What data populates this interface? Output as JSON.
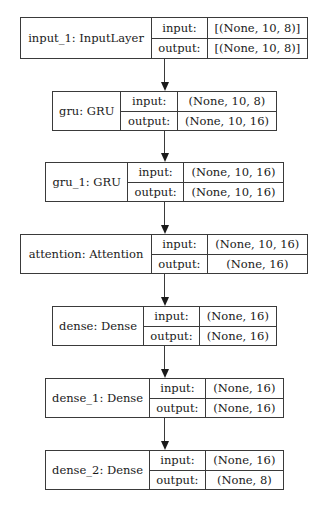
{
  "diagram": {
    "type": "keras-model-plot",
    "nodes": [
      {
        "id": "input_1",
        "label": "input_1: InputLayer",
        "input_key": "input:",
        "input_value": "[(None, 10, 8)]",
        "output_key": "output:",
        "output_value": "[(None, 10, 8)]",
        "layout": {
          "left": 20,
          "top": 17,
          "label_w": 132,
          "key_w": 56,
          "val_w": 100,
          "h": 42
        }
      },
      {
        "id": "gru",
        "label": "gru: GRU",
        "input_key": "input:",
        "input_value": "(None, 10, 8)",
        "output_key": "output:",
        "output_value": "(None, 10, 16)",
        "layout": {
          "left": 52,
          "top": 91,
          "label_w": 69,
          "key_w": 57,
          "val_w": 99,
          "h": 40
        }
      },
      {
        "id": "gru_1",
        "label": "gru_1: GRU",
        "input_key": "input:",
        "input_value": "(None, 10, 16)",
        "output_key": "output:",
        "output_value": "(None, 10, 16)",
        "layout": {
          "left": 45,
          "top": 162,
          "label_w": 83,
          "key_w": 56,
          "val_w": 100,
          "h": 40
        }
      },
      {
        "id": "attention",
        "label": "attention: Attention",
        "input_key": "input:",
        "input_value": "(None, 10, 16)",
        "output_key": "output:",
        "output_value": "(None, 16)",
        "layout": {
          "left": 20,
          "top": 234,
          "label_w": 132,
          "key_w": 56,
          "val_w": 100,
          "h": 40
        }
      },
      {
        "id": "dense",
        "label": "dense: Dense",
        "input_key": "input:",
        "input_value": "(None, 16)",
        "output_key": "output:",
        "output_value": "(None, 16)",
        "layout": {
          "left": 52,
          "top": 306,
          "label_w": 92,
          "key_w": 56,
          "val_w": 77,
          "h": 40
        }
      },
      {
        "id": "dense_1",
        "label": "dense_1: Dense",
        "input_key": "input:",
        "input_value": "(None, 16)",
        "output_key": "output:",
        "output_value": "(None, 16)",
        "layout": {
          "left": 45,
          "top": 378,
          "label_w": 105,
          "key_w": 56,
          "val_w": 78,
          "h": 40
        }
      },
      {
        "id": "dense_2",
        "label": "dense_2: Dense",
        "input_key": "input:",
        "input_value": "(None, 16)",
        "output_key": "output:",
        "output_value": "(None, 8)",
        "layout": {
          "left": 45,
          "top": 450,
          "label_w": 105,
          "key_w": 56,
          "val_w": 78,
          "h": 40
        }
      }
    ],
    "edges": [
      {
        "from": "input_1",
        "to": "gru"
      },
      {
        "from": "gru",
        "to": "gru_1"
      },
      {
        "from": "gru_1",
        "to": "attention"
      },
      {
        "from": "attention",
        "to": "dense"
      },
      {
        "from": "dense",
        "to": "dense_1"
      },
      {
        "from": "dense_1",
        "to": "dense_2"
      }
    ],
    "edge_x": 164,
    "colors": {
      "line": "#3a3a3a",
      "text": "#1a1a1a",
      "background": "#ffffff"
    }
  }
}
